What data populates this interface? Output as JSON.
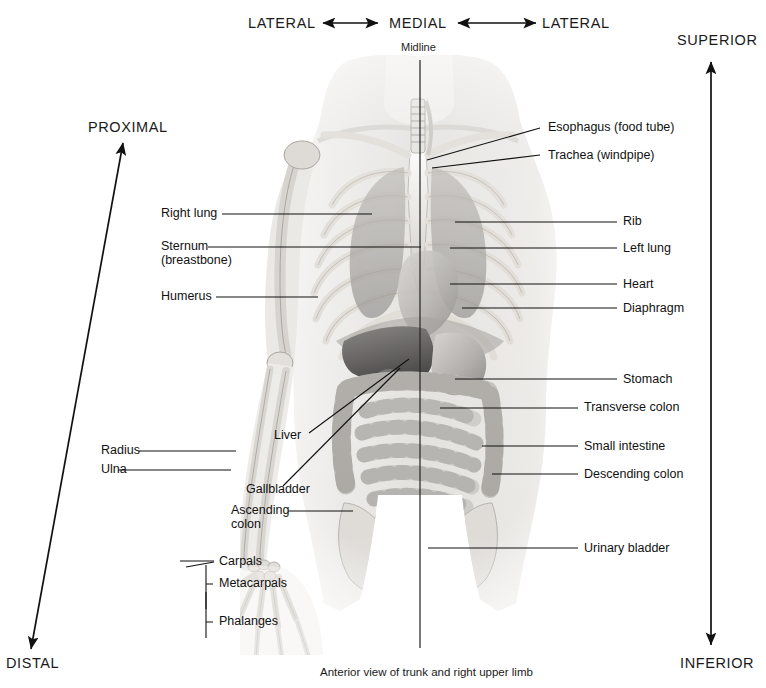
{
  "figure": {
    "caption": "Anterior view of trunk and right upper limb",
    "midline_label": "Midline"
  },
  "direction_labels": {
    "lateral_left": "LATERAL",
    "medial": "MEDIAL",
    "lateral_right": "LATERAL",
    "superior": "SUPERIOR",
    "inferior": "INFERIOR",
    "proximal": "PROXIMAL",
    "distal": "DISTAL"
  },
  "left_labels": [
    {
      "text": "Right lung"
    },
    {
      "text": "Sternum"
    },
    {
      "text": "(breastbone)"
    },
    {
      "text": "Humerus"
    },
    {
      "text": "Radius"
    },
    {
      "text": "Ulna"
    },
    {
      "text": "Liver"
    },
    {
      "text": "Gallbladder"
    },
    {
      "text": "Ascending"
    },
    {
      "text": "colon"
    },
    {
      "text": "Carpals"
    },
    {
      "text": "Metacarpals"
    },
    {
      "text": "Phalanges"
    }
  ],
  "right_labels": [
    {
      "text": "Esophagus (food tube)"
    },
    {
      "text": "Trachea (windpipe)"
    },
    {
      "text": "Rib"
    },
    {
      "text": "Left lung"
    },
    {
      "text": "Heart"
    },
    {
      "text": "Diaphragm"
    },
    {
      "text": "Stomach"
    },
    {
      "text": "Transverse colon"
    },
    {
      "text": "Small intestine"
    },
    {
      "text": "Descending colon"
    },
    {
      "text": "Urinary bladder"
    }
  ],
  "colors": {
    "ink": "#111111",
    "background": "#ffffff",
    "bone": "#e8e6e2",
    "organ": "#b9b6b2",
    "shadow": "#6e6b68"
  }
}
